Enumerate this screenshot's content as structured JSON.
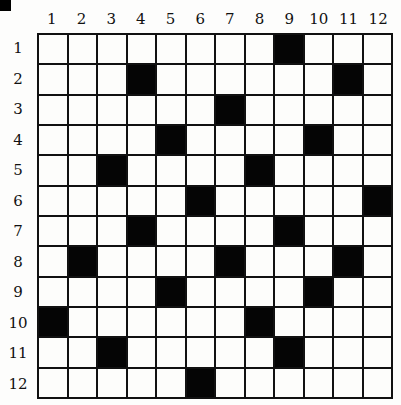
{
  "puzzle": {
    "rows": 12,
    "cols": 12,
    "column_labels": [
      "1",
      "2",
      "3",
      "4",
      "5",
      "6",
      "7",
      "8",
      "9",
      "10",
      "11",
      "12"
    ],
    "row_labels": [
      "1",
      "2",
      "3",
      "4",
      "5",
      "6",
      "7",
      "8",
      "9",
      "10",
      "11",
      "12"
    ],
    "black_cells": [
      [
        1,
        9
      ],
      [
        2,
        4
      ],
      [
        2,
        11
      ],
      [
        3,
        7
      ],
      [
        4,
        5
      ],
      [
        4,
        10
      ],
      [
        5,
        3
      ],
      [
        5,
        8
      ],
      [
        6,
        6
      ],
      [
        6,
        12
      ],
      [
        7,
        4
      ],
      [
        7,
        9
      ],
      [
        8,
        2
      ],
      [
        8,
        7
      ],
      [
        8,
        11
      ],
      [
        9,
        5
      ],
      [
        9,
        10
      ],
      [
        10,
        1
      ],
      [
        10,
        8
      ],
      [
        11,
        3
      ],
      [
        11,
        9
      ],
      [
        12,
        6
      ]
    ],
    "colors": {
      "filled": "#050505",
      "empty": "#fdfdfb",
      "line": "#111111"
    }
  }
}
